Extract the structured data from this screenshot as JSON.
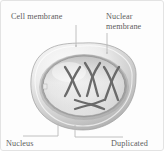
{
  "figure": {
    "background_color": "#fdfdfd",
    "border_color": "#e3e3e3"
  },
  "labels": {
    "cell_membrane": "Cell membrane",
    "nuclear_membrane": "Nuclear\nmembrane",
    "nucleus": "Nucleus",
    "duplicated": "Duplicated"
  },
  "colors": {
    "text": "#5d5d5d",
    "leader_line": "#b9b9b9",
    "cell_membrane_light": "#f2f2f2",
    "cell_membrane_mid": "#cfcfcf",
    "cell_membrane_dark": "#a8a8a8",
    "nucleoplasm_light": "#f4f4f4",
    "nucleoplasm_mid": "#dcdcdc",
    "nuclear_envelope": "#9a9a9a",
    "chromosome": "#6a6a6a"
  },
  "diagram": {
    "cell_membrane_shape": "irregular-rounded-blob",
    "nucleus_shape": "rounded-oval",
    "chromosome_count": 4,
    "chromosome_shape": "x-shaped-duplicated",
    "chromosomes": [
      {
        "name": "chromosome-1",
        "orientation": "upright-left",
        "cx": 71,
        "cy": 78
      },
      {
        "name": "chromosome-2",
        "orientation": "upright-center",
        "cx": 91,
        "cy": 76
      },
      {
        "name": "chromosome-3",
        "orientation": "upright-right",
        "cx": 110,
        "cy": 80
      },
      {
        "name": "chromosome-4",
        "orientation": "horizontal",
        "cx": 88,
        "cy": 103
      }
    ]
  },
  "icons": {
    "cell": "cell-icon",
    "nucleus": "nucleus-icon",
    "chromosome": "chromosome-icon"
  }
}
